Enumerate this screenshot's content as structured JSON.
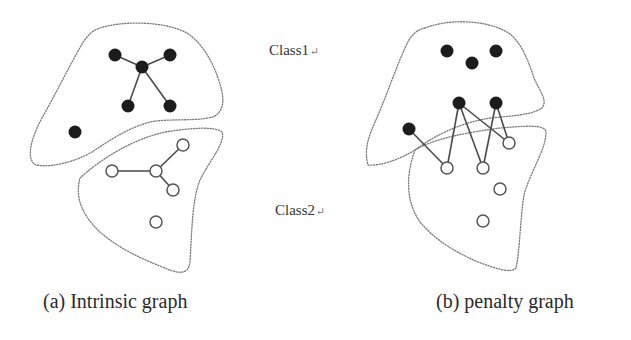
{
  "labels": {
    "class1": "Class1",
    "class2": "Class2",
    "return_mark": "↵",
    "caption_a": "(a) Intrinsic graph",
    "caption_b": "(b) penalty graph"
  },
  "colors": {
    "filled_node": "#1c1c1c",
    "open_node_stroke": "#555555",
    "edge": "#4a4a4a",
    "region_outline": "#7a7a7a"
  },
  "graphs": [
    {
      "id": "intrinsic",
      "caption": "(a) Intrinsic graph",
      "class1_nodes": [
        [
          115,
          55
        ],
        [
          170,
          55
        ],
        [
          142,
          67
        ],
        [
          128,
          106
        ],
        [
          170,
          106
        ],
        [
          75,
          132
        ]
      ],
      "class2_nodes": [
        [
          112,
          171
        ],
        [
          156,
          171
        ],
        [
          183,
          145
        ],
        [
          173,
          190
        ],
        [
          156,
          222
        ]
      ],
      "edges": [
        [
          [
            142,
            67
          ],
          [
            115,
            55
          ]
        ],
        [
          [
            142,
            67
          ],
          [
            170,
            55
          ]
        ],
        [
          [
            142,
            67
          ],
          [
            128,
            106
          ]
        ],
        [
          [
            142,
            67
          ],
          [
            170,
            106
          ]
        ],
        [
          [
            156,
            171
          ],
          [
            112,
            171
          ]
        ],
        [
          [
            156,
            171
          ],
          [
            183,
            145
          ]
        ],
        [
          [
            156,
            171
          ],
          [
            173,
            190
          ]
        ]
      ]
    },
    {
      "id": "penalty",
      "caption": "(b) penalty graph",
      "class1_nodes": [
        [
          447,
          51
        ],
        [
          496,
          51
        ],
        [
          472,
          63
        ],
        [
          459,
          103
        ],
        [
          496,
          103
        ],
        [
          409,
          129
        ]
      ],
      "class2_nodes": [
        [
          509,
          143
        ],
        [
          447,
          168
        ],
        [
          483,
          168
        ],
        [
          500,
          189
        ],
        [
          483,
          221
        ]
      ],
      "edges": [
        [
          [
            409,
            129
          ],
          [
            447,
            168
          ]
        ],
        [
          [
            459,
            103
          ],
          [
            447,
            168
          ]
        ],
        [
          [
            459,
            103
          ],
          [
            483,
            168
          ]
        ],
        [
          [
            459,
            103
          ],
          [
            509,
            143
          ]
        ],
        [
          [
            496,
            103
          ],
          [
            483,
            168
          ]
        ],
        [
          [
            496,
            103
          ],
          [
            509,
            143
          ]
        ]
      ]
    }
  ]
}
